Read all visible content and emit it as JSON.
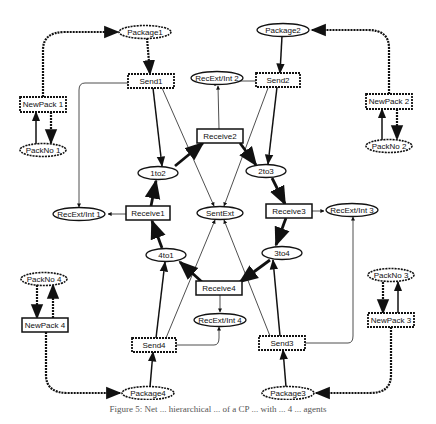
{
  "diagram": {
    "type": "petri-net",
    "places": {
      "package1": "Package1",
      "package2": "Package2",
      "package3": "Package3",
      "package4": "Package4",
      "packno1": "PackNo 1",
      "packno2": "PackNo 2",
      "packno3": "PackNo 3",
      "packno4": "PackNo 4",
      "p1to2": "1to2",
      "p2to3": "2to3",
      "p3to4": "3to4",
      "p4to1": "4to1",
      "sentext": "SentExt",
      "recextint1": "RecExt/Int 1",
      "recextint2": "RecExt/Int 2",
      "recextint3": "RecExt/Int 3",
      "recextint4": "RecExt/Int 4"
    },
    "transitions": {
      "send1": "Send1",
      "send2": "Send2",
      "send3": "Send3",
      "send4": "Send4",
      "newpack1": "NewPack 1",
      "newpack2": "NewPack 2",
      "newpack3": "NewPack 3",
      "newpack4": "NewPack 4",
      "receive1": "Receive1",
      "receive2": "Receive2",
      "receive3": "Receive3",
      "receive4": "Receive4"
    },
    "arcs": [
      {
        "from": "NewPack 1",
        "to": "Package1"
      },
      {
        "from": "Package1",
        "to": "Send1"
      },
      {
        "from": "PackNo 1",
        "to": "NewPack 1"
      },
      {
        "from": "NewPack 1",
        "to": "PackNo 1"
      },
      {
        "from": "Send1",
        "to": "1to2"
      },
      {
        "from": "Send1",
        "to": "RecExt/Int 1"
      },
      {
        "from": "Send1",
        "to": "SentExt"
      },
      {
        "from": "NewPack 2",
        "to": "Package2"
      },
      {
        "from": "Package2",
        "to": "Send2"
      },
      {
        "from": "PackNo 2",
        "to": "NewPack 2"
      },
      {
        "from": "NewPack 2",
        "to": "PackNo 2"
      },
      {
        "from": "Send2",
        "to": "2to3"
      },
      {
        "from": "Send2",
        "to": "RecExt/Int 2"
      },
      {
        "from": "Send2",
        "to": "SentExt"
      },
      {
        "from": "NewPack 3",
        "to": "Package3"
      },
      {
        "from": "Package3",
        "to": "Send3"
      },
      {
        "from": "PackNo 3",
        "to": "NewPack 3"
      },
      {
        "from": "NewPack 3",
        "to": "PackNo 3"
      },
      {
        "from": "Send3",
        "to": "3to4"
      },
      {
        "from": "Send3",
        "to": "RecExt/Int 3"
      },
      {
        "from": "Send3",
        "to": "SentExt"
      },
      {
        "from": "NewPack 4",
        "to": "Package4"
      },
      {
        "from": "Package4",
        "to": "Send4"
      },
      {
        "from": "PackNo 4",
        "to": "NewPack 4"
      },
      {
        "from": "NewPack 4",
        "to": "PackNo 4"
      },
      {
        "from": "Send4",
        "to": "4to1"
      },
      {
        "from": "Send4",
        "to": "RecExt/Int 4"
      },
      {
        "from": "Send4",
        "to": "SentExt"
      },
      {
        "from": "1to2",
        "to": "Receive2"
      },
      {
        "from": "Receive2",
        "to": "2to3"
      },
      {
        "from": "Receive2",
        "to": "RecExt/Int 2"
      },
      {
        "from": "2to3",
        "to": "Receive3"
      },
      {
        "from": "Receive3",
        "to": "3to4"
      },
      {
        "from": "Receive3",
        "to": "RecExt/Int 3"
      },
      {
        "from": "3to4",
        "to": "Receive4"
      },
      {
        "from": "Receive4",
        "to": "4to1"
      },
      {
        "from": "Receive4",
        "to": "RecExt/Int 4"
      },
      {
        "from": "4to1",
        "to": "Receive1"
      },
      {
        "from": "Receive1",
        "to": "1to2"
      },
      {
        "from": "Receive1",
        "to": "RecExt/Int 1"
      }
    ]
  },
  "caption": "Figure 5: Net ... hierarchical ... of a CP ... with ... 4 ... agents"
}
